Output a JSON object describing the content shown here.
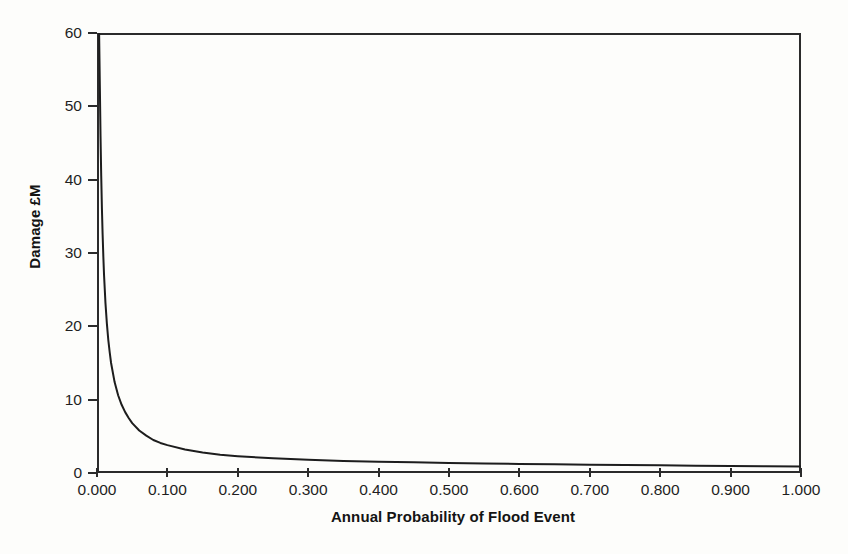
{
  "chart_data": {
    "type": "line",
    "title": "",
    "xlabel": "Annual Probability of Flood Event",
    "ylabel": "Damage £M",
    "xlim": [
      0.0,
      1.0
    ],
    "ylim": [
      0,
      60
    ],
    "grid": false,
    "legend": null,
    "x_tick_labels": [
      "0.000",
      "0.100",
      "0.200",
      "0.300",
      "0.400",
      "0.500",
      "0.600",
      "0.700",
      "0.800",
      "0.900",
      "1.000"
    ],
    "x_tick_values": [
      0.0,
      0.1,
      0.2,
      0.3,
      0.4,
      0.5,
      0.6,
      0.7,
      0.8,
      0.9,
      1.0
    ],
    "y_tick_labels": [
      "0",
      "10",
      "20",
      "30",
      "40",
      "50",
      "60"
    ],
    "y_tick_values": [
      0,
      10,
      20,
      30,
      40,
      50,
      60
    ],
    "series": [
      {
        "name": "Damage",
        "color": "#1d1d1d",
        "line_width": 2,
        "x": [
          0.003,
          0.004,
          0.005,
          0.006,
          0.007,
          0.008,
          0.009,
          0.01,
          0.012,
          0.014,
          0.016,
          0.018,
          0.02,
          0.025,
          0.03,
          0.035,
          0.04,
          0.045,
          0.05,
          0.06,
          0.07,
          0.08,
          0.09,
          0.1,
          0.125,
          0.15,
          0.175,
          0.2,
          0.25,
          0.3,
          0.35,
          0.4,
          0.45,
          0.5,
          0.55,
          0.6,
          0.65,
          0.7,
          0.75,
          0.8,
          0.85,
          0.9,
          0.95,
          1.0
        ],
        "y": [
          60.0,
          53.0,
          46.0,
          40.5,
          36.0,
          32.5,
          29.5,
          27.0,
          23.2,
          20.4,
          18.2,
          16.5,
          15.0,
          12.4,
          10.6,
          9.3,
          8.3,
          7.5,
          6.8,
          5.8,
          5.1,
          4.5,
          4.1,
          3.8,
          3.2,
          2.8,
          2.5,
          2.3,
          2.0,
          1.8,
          1.65,
          1.55,
          1.45,
          1.38,
          1.3,
          1.24,
          1.18,
          1.13,
          1.08,
          1.04,
          1.0,
          0.96,
          0.92,
          0.88
        ]
      }
    ]
  },
  "axes": {
    "y_axis_title": "Damage £M",
    "x_axis_title": "Annual Probability of Flood Event"
  },
  "colors": {
    "background": "#fdfdfb",
    "axis": "#2b2b2b",
    "curve": "#1d1d1d",
    "text": "#1a1a1a"
  }
}
